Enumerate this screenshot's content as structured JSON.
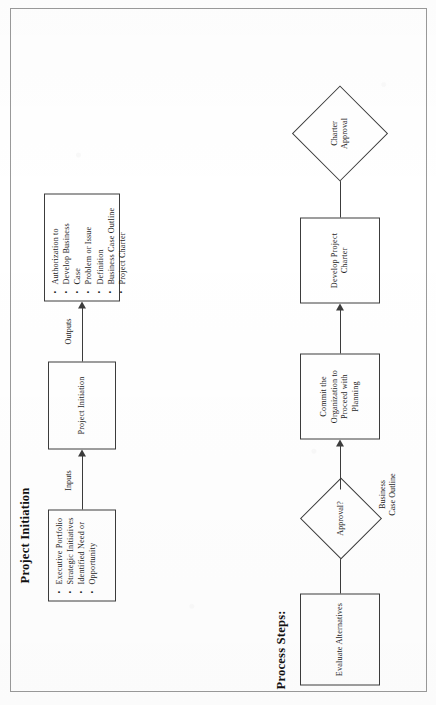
{
  "document": {
    "page_border_color": "#9a9a9a",
    "ink_color": "#3c3c3c",
    "rotation": "90deg counter-clockwise"
  },
  "ipo_section": {
    "title": "Project Initiation",
    "inputs": {
      "edge_label": "Inputs",
      "items": [
        "Executive Portfolio",
        "Strategic Initiatives",
        "Identified Need or",
        "Opportunity"
      ]
    },
    "process": {
      "label": "Project Initiation"
    },
    "outputs": {
      "edge_label": "Outputs",
      "items": [
        "Authorization to",
        "Develop Business",
        "Case",
        "Problem or Issue",
        "Definition",
        "Business Case Outline",
        "Project Charter"
      ]
    }
  },
  "process_steps_section": {
    "title": "Process Steps:",
    "steps": [
      {
        "id": "evaluate-alternatives",
        "shape": "box",
        "label": "Evaluate Alternatives"
      },
      {
        "id": "approval-decision",
        "shape": "diamond",
        "label": "Approval?"
      },
      {
        "id": "commit-organization",
        "shape": "box",
        "label": "Commit the\nOrganization to\nProceed with\nPlanning"
      },
      {
        "id": "develop-project-charter",
        "shape": "box",
        "label": "Develop Project\nCharter"
      },
      {
        "id": "charter-approval",
        "shape": "diamond",
        "label": "Charter\nApproval"
      }
    ],
    "edge_labels": [
      {
        "id": "business-case-outline",
        "line1": "Business",
        "line2": "Case Outline"
      }
    ]
  },
  "node_text": {
    "commit_l1": "Commit the",
    "commit_l2": "Organization to",
    "commit_l3": "Proceed with",
    "commit_l4": "Planning",
    "develop_l1": "Develop Project",
    "develop_l2": "Charter",
    "charter_l1": "Charter",
    "charter_l2": "Approval",
    "evaluate": "Evaluate Alternatives",
    "approval_q": "Approval?",
    "process_center": "Project Initiation"
  }
}
